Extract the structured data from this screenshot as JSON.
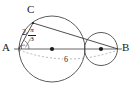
{
  "figure": {
    "type": "geometry-diagram",
    "background_color": "#ffffff",
    "stroke_color": "#4a4a4a",
    "text_color": "#1a1a1a",
    "dashed_color": "#8a8a8a",
    "labels": {
      "point_a": "A",
      "point_b": "B",
      "point_c": "C",
      "side_ac": "2",
      "angle_numerator": "π",
      "angle_denominator": "3",
      "diameter": "6"
    },
    "points": [
      {
        "name": "A",
        "x": 19,
        "y": 49,
        "label_x": 3,
        "label_y": 43
      },
      {
        "name": "B",
        "x": 118,
        "y": 49,
        "label_x": 121,
        "label_y": 43
      },
      {
        "name": "C",
        "x": 33,
        "y": 23,
        "label_x": 27,
        "label_y": 8
      }
    ],
    "circles": [
      {
        "name": "large-circle",
        "cx": 52,
        "cy": 49,
        "r": 33
      },
      {
        "name": "small-circle",
        "cx": 101,
        "cy": 49,
        "r": 16.5
      }
    ],
    "centers": [
      {
        "name": "large-circle-center",
        "cx": 52,
        "cy": 49
      },
      {
        "name": "small-circle-center",
        "cx": 101,
        "cy": 49
      }
    ],
    "segments": [
      {
        "name": "axis-ab",
        "x1": 14,
        "y1": 49,
        "x2": 122,
        "y2": 49,
        "style": "solid"
      },
      {
        "name": "segment-ac",
        "x1": 19,
        "y1": 49,
        "x2": 33,
        "y2": 23,
        "style": "solid"
      },
      {
        "name": "segment-cb",
        "x1": 33,
        "y1": 23,
        "x2": 118,
        "y2": 49,
        "style": "solid"
      }
    ],
    "dashed_paths": [
      {
        "name": "dashed-chord-ab",
        "style": "dashed"
      }
    ],
    "markers": [
      {
        "name": "right-angle-marker",
        "x": 21,
        "y": 45,
        "size": 5
      },
      {
        "name": "angle-arc-at-a",
        "radius": 9
      }
    ],
    "annotations": {
      "length_ac": {
        "text": "2",
        "x": 24,
        "y": 30
      },
      "angle_a": {
        "numerator": "π",
        "denominator": "3",
        "x": 31,
        "y": 30
      },
      "diameter_label": {
        "text": "6",
        "x": 63,
        "y": 57
      }
    }
  }
}
